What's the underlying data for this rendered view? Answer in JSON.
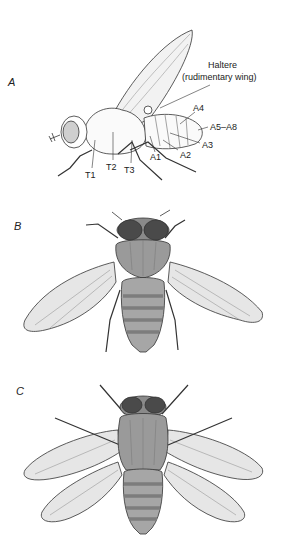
{
  "figure": {
    "panels": [
      {
        "letter": "A",
        "view": "lateral",
        "labels": {
          "haltere_line1": "Haltere",
          "haltere_line2": "(rudimentary wing)",
          "a4": "A4",
          "a5_a8": "A5–A8",
          "a3": "A3",
          "a2": "A2",
          "a1": "A1",
          "t1": "T1",
          "t2": "T2",
          "t3": "T3"
        }
      },
      {
        "letter": "B",
        "view": "dorsal, wild type"
      },
      {
        "letter": "C",
        "view": "dorsal, four-winged mutant"
      }
    ],
    "colors": {
      "outline": "#333333",
      "wing_fill": "#e6e6e6",
      "body_fill": "#9a9a9a",
      "eye_fill": "#4a4a4a",
      "stripe_fill": "#7d7d7d",
      "background": "#ffffff"
    }
  }
}
